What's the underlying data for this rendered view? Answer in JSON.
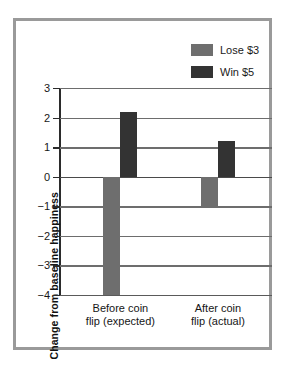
{
  "chart_data": {
    "type": "bar",
    "title": "",
    "xlabel": "",
    "ylabel": "Change from baseline happiness",
    "categories": [
      "Before coin flip (expected)",
      "After coin flip (actual)"
    ],
    "category_lines": [
      [
        "Before coin",
        "flip (expected)"
      ],
      [
        "After coin",
        "flip (actual)"
      ]
    ],
    "series": [
      {
        "name": "Lose $3",
        "color": "#6e6e6e",
        "values": [
          -4,
          -1
        ]
      },
      {
        "name": "Win $5",
        "color": "#333333",
        "values": [
          2.2,
          1.2
        ]
      }
    ],
    "ylim": [
      -4,
      3
    ],
    "yticks": [
      3,
      2,
      1,
      0,
      -1,
      -2,
      -3,
      -4
    ],
    "ytick_labels": [
      "3",
      "2",
      "1",
      "0",
      "−1",
      "−2",
      "−3",
      "−4"
    ],
    "grid": true,
    "legend_position": "top-right",
    "legend_entries": [
      {
        "label": "Lose $3",
        "color": "#6e6e6e"
      },
      {
        "label": "Win $5",
        "color": "#333333"
      }
    ]
  },
  "frame": {
    "border_color": "#9a9a9a",
    "background": "#ffffff"
  }
}
